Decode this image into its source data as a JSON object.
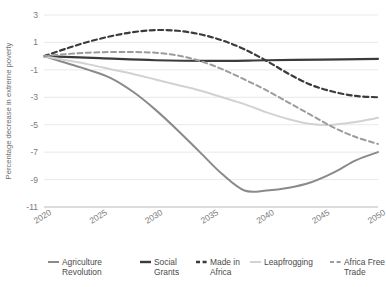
{
  "chart_data": {
    "type": "line",
    "title": "",
    "xlabel": "",
    "ylabel": "Percentage decrease in extreme poverty",
    "x": [
      2020,
      2025,
      2030,
      2035,
      2040,
      2045,
      2050
    ],
    "xlim": [
      2020,
      2050
    ],
    "ylim": [
      -11,
      3
    ],
    "yticks": [
      3,
      1,
      -1,
      -3,
      -5,
      -7,
      -9,
      -11
    ],
    "ytick_labels": [
      "3",
      "1",
      "-1",
      "-3",
      "-5",
      "-7",
      "-9",
      "-11"
    ],
    "xtick_labels": [
      "2020",
      "2025",
      "2030",
      "2035",
      "2040",
      "2045",
      "2050"
    ],
    "grid": true,
    "legend_position": "bottom",
    "series": [
      {
        "name": "Agriculture Revolution",
        "color": "#8a8a8a",
        "style": "solid",
        "width": 2.0,
        "x": [
          2020,
          2022,
          2024,
          2026,
          2028,
          2030,
          2032,
          2034,
          2036,
          2038,
          2040,
          2042,
          2044,
          2046,
          2048,
          2050
        ],
        "values": [
          0,
          -0.5,
          -1.0,
          -1.6,
          -2.6,
          -3.9,
          -5.4,
          -7.0,
          -8.6,
          -9.8,
          -9.8,
          -9.6,
          -9.2,
          -8.5,
          -7.6,
          -7.0
        ]
      },
      {
        "name": "Social Grants",
        "color": "#3b3b3b",
        "style": "solid",
        "width": 2.2,
        "x": [
          2020,
          2025,
          2030,
          2035,
          2040,
          2045,
          2050
        ],
        "values": [
          0,
          -0.15,
          -0.3,
          -0.35,
          -0.3,
          -0.25,
          -0.2
        ]
      },
      {
        "name": "Made in Africa",
        "color": "#3b3b3b",
        "style": "dashed",
        "width": 2.2,
        "x": [
          2020,
          2022,
          2024,
          2026,
          2028,
          2030,
          2032,
          2034,
          2036,
          2038,
          2040,
          2042,
          2044,
          2046,
          2048,
          2050
        ],
        "values": [
          0,
          0.55,
          1.05,
          1.45,
          1.75,
          1.9,
          1.85,
          1.6,
          1.15,
          0.5,
          -0.35,
          -1.3,
          -2.1,
          -2.6,
          -2.9,
          -3.0
        ]
      },
      {
        "name": "Leapfrogging",
        "color": "#d2d2d2",
        "style": "solid",
        "width": 2.0,
        "x": [
          2020,
          2022,
          2024,
          2026,
          2028,
          2030,
          2032,
          2034,
          2036,
          2038,
          2040,
          2042,
          2044,
          2046,
          2048,
          2050
        ],
        "values": [
          0,
          -0.3,
          -0.6,
          -0.95,
          -1.3,
          -1.7,
          -2.1,
          -2.5,
          -3.0,
          -3.5,
          -4.1,
          -4.6,
          -4.95,
          -5.0,
          -4.8,
          -4.5
        ]
      },
      {
        "name": "Africa Free Trade",
        "color": "#9c9c9c",
        "style": "dashed",
        "width": 2.0,
        "x": [
          2020,
          2022,
          2024,
          2026,
          2028,
          2030,
          2032,
          2034,
          2036,
          2038,
          2040,
          2042,
          2044,
          2046,
          2048,
          2050
        ],
        "values": [
          0,
          0.15,
          0.25,
          0.3,
          0.3,
          0.25,
          0.05,
          -0.35,
          -0.95,
          -1.7,
          -2.5,
          -3.4,
          -4.3,
          -5.2,
          -5.9,
          -6.4
        ]
      }
    ]
  },
  "legend": {
    "items": [
      {
        "label": "Agriculture Revolution",
        "color": "#8a8a8a",
        "style": "solid"
      },
      {
        "label": "Social Grants",
        "color": "#3b3b3b",
        "style": "solid"
      },
      {
        "label": "Made in Africa",
        "color": "#3b3b3b",
        "style": "dashed"
      },
      {
        "label": "Leapfrogging",
        "color": "#d2d2d2",
        "style": "solid"
      },
      {
        "label": "Africa Free Trade",
        "color": "#9c9c9c",
        "style": "dashed"
      }
    ]
  }
}
